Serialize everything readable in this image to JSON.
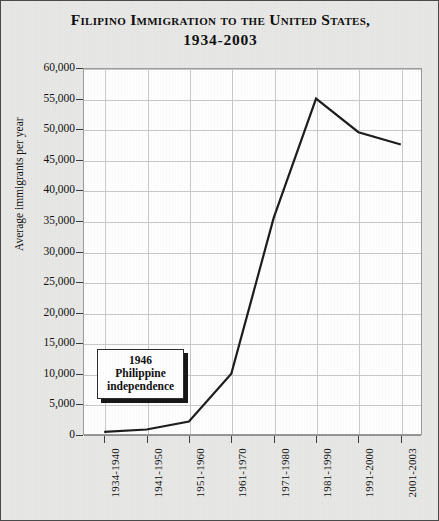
{
  "chart_data": {
    "type": "line",
    "title": "Filipino Immigration to the United States,",
    "subtitle": "1934-2003",
    "xlabel": "",
    "ylabel": "Average immigrants per year",
    "categories": [
      "1934-1940",
      "1941-1950",
      "1951-1960",
      "1961-1970",
      "1971-1980",
      "1981-1990",
      "1991-2000",
      "2001-2003"
    ],
    "values": [
      500,
      900,
      2200,
      10000,
      35500,
      55000,
      49500,
      47500
    ],
    "ylim": [
      0,
      60000
    ],
    "ytick_values": [
      0,
      5000,
      10000,
      15000,
      20000,
      25000,
      30000,
      35000,
      40000,
      45000,
      50000,
      55000,
      60000
    ],
    "ytick_labels": [
      "0",
      "5,000",
      "10,000",
      "15,000",
      "20,000",
      "25,000",
      "30,000",
      "35,000",
      "40,000",
      "45,000",
      "50,000",
      "55,000",
      "60,000"
    ],
    "grid": true,
    "legend": "none",
    "line_color": "#1a1a1a",
    "annotations": [
      {
        "name": "philippine-independence-note",
        "line1": "1946",
        "line2": "Philippine",
        "line3": "independence"
      }
    ]
  },
  "style": {
    "background": "#e8e8e6",
    "plot_background": "#ffffff",
    "grid_color": "#c9c9c9",
    "frame_color": "#4a4a4a"
  }
}
